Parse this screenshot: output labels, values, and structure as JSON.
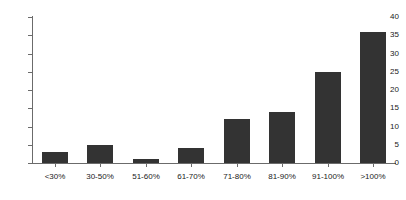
{
  "chart_data": {
    "type": "bar",
    "title": "",
    "subtitle": "",
    "xlabel": "",
    "ylabel": "",
    "categories": [
      "<30%",
      "30-50%",
      "51-60%",
      "61-70%",
      "71-80%",
      "81-90%",
      "91-100%",
      ">100%"
    ],
    "values": [
      3,
      5,
      1,
      4,
      12,
      14,
      25,
      36
    ],
    "ylim": [
      0,
      40
    ],
    "ytick_values": [
      0,
      5,
      10,
      15,
      20,
      25,
      30,
      35,
      40
    ],
    "ytick_labels": [
      "0",
      "5",
      "10",
      "15",
      "20",
      "25",
      "30",
      "35",
      "40"
    ],
    "grid": false,
    "legend": false,
    "series": [
      {
        "name": "",
        "values": [
          3,
          5,
          1,
          4,
          12,
          14,
          25,
          36
        ],
        "color": "#333333"
      }
    ]
  },
  "style": {
    "bar_color": "#333333",
    "axis_color": "#6b6b6b",
    "text_color": "#1a1a1a",
    "background": "#ffffff"
  }
}
